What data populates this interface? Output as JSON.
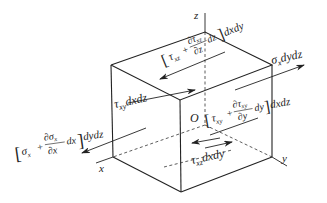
{
  "diagram": {
    "title": "",
    "type": "3D stress element (infinitesimal cube) with surface forces",
    "axes": {
      "x": "x",
      "y": "y",
      "z": "z",
      "origin": "O"
    },
    "labels": {
      "tau_xz_top": {
        "lead": "τ",
        "sub": "xz",
        "plus": "+",
        "num": "∂τ",
        "num_sub": "xz",
        "den": "∂z",
        "tail": "dz",
        "suffix": "dxdy"
      },
      "sigma_x_right": {
        "base": "σ",
        "sub": "x",
        "suffix": "dydz"
      },
      "tau_xy_left": {
        "base": "τ",
        "sub": "xy",
        "suffix": "dxdz"
      },
      "tau_xy_right": {
        "lead": "τ",
        "sub": "xy",
        "plus": "+",
        "num": "∂τ",
        "num_sub": "xy",
        "den": "∂y",
        "tail": "dy",
        "suffix": "dxdz"
      },
      "sigma_x_left": {
        "lead": "σ",
        "sub": "x",
        "plus": "+",
        "num": "∂σ",
        "num_sub": "x",
        "den": "∂x",
        "tail": "dx",
        "suffix": "dydz"
      },
      "tau_xz_bottom": {
        "base": "τ",
        "sub": "xz",
        "suffix": "dxdy"
      }
    },
    "colors": {
      "ink": "#222222",
      "background": "#ffffff"
    }
  }
}
